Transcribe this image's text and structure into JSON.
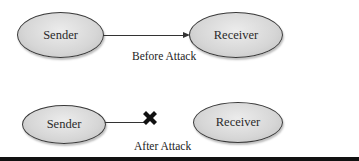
{
  "diagram": {
    "before": {
      "sender_label": "Sender",
      "receiver_label": "Receiver",
      "caption": "Before Attack",
      "connection": "arrow"
    },
    "after": {
      "sender_label": "Sender",
      "receiver_label": "Receiver",
      "caption": "After Attack",
      "connection": "broken-line-with-x-mark"
    }
  },
  "colors": {
    "node_fill": "#d6d6d6",
    "node_border": "#3a3a3a",
    "line": "#333333",
    "x_mark": "#111111",
    "bottom_bar": "#111111"
  }
}
